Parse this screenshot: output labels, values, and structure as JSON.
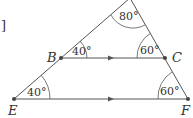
{
  "diagram": {
    "bracket": "]",
    "points": {
      "A": {
        "x": 130,
        "y": -2
      },
      "B": {
        "x": 61,
        "y": 58,
        "label": "B"
      },
      "C": {
        "x": 165,
        "y": 58,
        "label": "C"
      },
      "E": {
        "x": 14,
        "y": 99,
        "label": "E"
      },
      "F": {
        "x": 188,
        "y": 99,
        "label": "F"
      }
    },
    "angles": {
      "apex": "80°",
      "B": "40°",
      "C": "60°",
      "E": "40°",
      "F": "60°"
    },
    "colors": {
      "line": "#555555",
      "text": "#333333"
    }
  }
}
